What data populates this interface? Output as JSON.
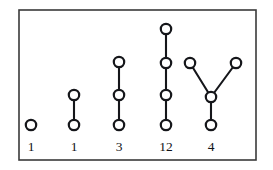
{
  "figure": {
    "kind": "tree-gallery-diagram",
    "background_color": "#ffffff",
    "frame": {
      "name": "figure-border",
      "x": 19,
      "y": 10,
      "width": 237,
      "height": 150,
      "stroke_color": "#3a3a3a",
      "stroke_width": 1.6
    },
    "node_style": {
      "radius": 5.2,
      "fill_color": "#ffffff",
      "stroke_color": "#15161a",
      "stroke_width": 2.2
    },
    "edge_style": {
      "stroke_color": "#15161a",
      "stroke_width": 2.1
    },
    "label_style": {
      "color": "#111216",
      "font_size": 13.5,
      "baseline_y": 151
    },
    "columns": [
      {
        "id": "tree-1",
        "label": "1",
        "label_x": 31,
        "node_count": 1,
        "edge_count": 0,
        "nodes": [
          {
            "id": "n1",
            "x": 31,
            "y": 125
          }
        ],
        "edges": []
      },
      {
        "id": "tree-2",
        "label": "1",
        "label_x": 74,
        "node_count": 2,
        "edge_count": 1,
        "nodes": [
          {
            "id": "n1",
            "x": 74,
            "y": 95
          },
          {
            "id": "n2",
            "x": 74,
            "y": 125
          }
        ],
        "edges": [
          {
            "from": "n1",
            "to": "n2"
          }
        ]
      },
      {
        "id": "tree-3",
        "label": "3",
        "label_x": 119,
        "node_count": 3,
        "edge_count": 2,
        "nodes": [
          {
            "id": "n1",
            "x": 119,
            "y": 62
          },
          {
            "id": "n2",
            "x": 119,
            "y": 95
          },
          {
            "id": "n3",
            "x": 119,
            "y": 125
          }
        ],
        "edges": [
          {
            "from": "n1",
            "to": "n2"
          },
          {
            "from": "n2",
            "to": "n3"
          }
        ]
      },
      {
        "id": "tree-4",
        "label": "12",
        "label_x": 166,
        "node_count": 4,
        "edge_count": 3,
        "nodes": [
          {
            "id": "n1",
            "x": 166,
            "y": 29
          },
          {
            "id": "n2",
            "x": 166,
            "y": 63
          },
          {
            "id": "n3",
            "x": 166,
            "y": 95
          },
          {
            "id": "n4",
            "x": 166,
            "y": 125
          }
        ],
        "edges": [
          {
            "from": "n1",
            "to": "n2"
          },
          {
            "from": "n2",
            "to": "n3"
          },
          {
            "from": "n3",
            "to": "n4"
          }
        ]
      },
      {
        "id": "tree-5",
        "label": "4",
        "label_x": 211,
        "node_count": 4,
        "edge_count": 3,
        "nodes": [
          {
            "id": "n1",
            "x": 190,
            "y": 63
          },
          {
            "id": "n2",
            "x": 236,
            "y": 63
          },
          {
            "id": "n3",
            "x": 211,
            "y": 97
          },
          {
            "id": "n4",
            "x": 211,
            "y": 125
          }
        ],
        "edges": [
          {
            "from": "n1",
            "to": "n3"
          },
          {
            "from": "n2",
            "to": "n3"
          },
          {
            "from": "n3",
            "to": "n4"
          }
        ]
      }
    ]
  }
}
